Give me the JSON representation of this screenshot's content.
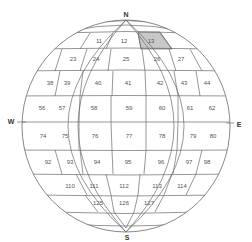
{
  "diagram": {
    "type": "globe-grid",
    "compass": {
      "north": "N",
      "south": "S",
      "west": "W",
      "east": "E"
    },
    "highlight_color": "#c8c8c8",
    "highlighted_cell": "13",
    "rows": [
      {
        "cells": [
          {
            "id": "11",
            "x": 99,
            "y": 41
          },
          {
            "id": "12",
            "x": 124,
            "y": 41
          },
          {
            "id": "13",
            "x": 151,
            "y": 41
          }
        ]
      },
      {
        "cells": [
          {
            "id": "23",
            "x": 73,
            "y": 59
          },
          {
            "id": "24",
            "x": 96,
            "y": 59
          },
          {
            "id": "25",
            "x": 126,
            "y": 59
          },
          {
            "id": "26",
            "x": 157,
            "y": 59
          },
          {
            "id": "27",
            "x": 181,
            "y": 59
          }
        ]
      },
      {
        "cells": [
          {
            "id": "38",
            "x": 50,
            "y": 83
          },
          {
            "id": "39",
            "x": 67,
            "y": 83
          },
          {
            "id": "40",
            "x": 98,
            "y": 83
          },
          {
            "id": "41",
            "x": 128,
            "y": 83
          },
          {
            "id": "42",
            "x": 160,
            "y": 83
          },
          {
            "id": "43",
            "x": 184,
            "y": 83
          },
          {
            "id": "44",
            "x": 207,
            "y": 83
          }
        ]
      },
      {
        "cells": [
          {
            "id": "56",
            "x": 42,
            "y": 108
          },
          {
            "id": "57",
            "x": 62,
            "y": 108
          },
          {
            "id": "58",
            "x": 94,
            "y": 108
          },
          {
            "id": "59",
            "x": 129,
            "y": 108
          },
          {
            "id": "60",
            "x": 162,
            "y": 108
          },
          {
            "id": "61",
            "x": 190,
            "y": 108
          },
          {
            "id": "62",
            "x": 212,
            "y": 108
          }
        ]
      },
      {
        "cells": [
          {
            "id": "74",
            "x": 43,
            "y": 136
          },
          {
            "id": "75",
            "x": 65,
            "y": 136
          },
          {
            "id": "76",
            "x": 95,
            "y": 136
          },
          {
            "id": "77",
            "x": 129,
            "y": 136
          },
          {
            "id": "78",
            "x": 162,
            "y": 136
          },
          {
            "id": "79",
            "x": 193,
            "y": 136
          },
          {
            "id": "80",
            "x": 213,
            "y": 136
          }
        ]
      },
      {
        "cells": [
          {
            "id": "92",
            "x": 48,
            "y": 162
          },
          {
            "id": "93",
            "x": 70,
            "y": 162
          },
          {
            "id": "94",
            "x": 97,
            "y": 162
          },
          {
            "id": "95",
            "x": 128,
            "y": 162
          },
          {
            "id": "96",
            "x": 161,
            "y": 162
          },
          {
            "id": "97",
            "x": 189,
            "y": 162
          },
          {
            "id": "98",
            "x": 207,
            "y": 162
          }
        ]
      },
      {
        "cells": [
          {
            "id": "110",
            "x": 70,
            "y": 186
          },
          {
            "id": "111",
            "x": 94,
            "y": 186
          },
          {
            "id": "112",
            "x": 124,
            "y": 186
          },
          {
            "id": "113",
            "x": 157,
            "y": 186
          },
          {
            "id": "114",
            "x": 182,
            "y": 186
          }
        ]
      },
      {
        "cells": [
          {
            "id": "125",
            "x": 98,
            "y": 203
          },
          {
            "id": "126",
            "x": 124,
            "y": 203
          },
          {
            "id": "127",
            "x": 149,
            "y": 203
          }
        ]
      }
    ]
  }
}
